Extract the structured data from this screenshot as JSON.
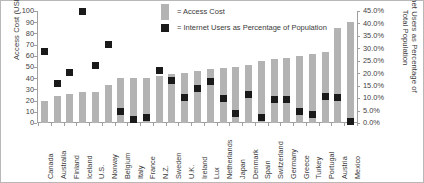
{
  "chart_data": {
    "type": "bar",
    "title": "",
    "subtitle": "",
    "xlabel": "",
    "ylabel": "Access Cost (USD)",
    "ylabel_superscript": "a",
    "y2label": "Internet Users as Percentage of Total Population",
    "ylim": [
      0,
      100
    ],
    "y2lim": [
      0,
      45
    ],
    "grid": false,
    "legend_position": "top-center",
    "y_ticks": [
      "0",
      "10",
      "20",
      "30",
      "40",
      "50",
      "60",
      "70",
      "80",
      "90",
      "100"
    ],
    "y_tick_values": [
      0,
      10,
      20,
      30,
      40,
      50,
      60,
      70,
      80,
      90,
      100
    ],
    "y2_ticks": [
      "0.0%",
      "5.0%",
      "10.0%",
      "15.0%",
      "20.0%",
      "25.0%",
      "30.0%",
      "35.0%",
      "40.0%",
      "45.0%"
    ],
    "y2_tick_values": [
      0,
      5,
      10,
      15,
      20,
      25,
      30,
      35,
      40,
      45
    ],
    "categories": [
      "Canada",
      "Australia",
      "Finland",
      "Iceland",
      "U.S.",
      "Norway",
      "Belgium",
      "Italy",
      "France",
      "N.Z.",
      "Sweden",
      "U.K.",
      "Ireland",
      "Lux",
      "Netherlands",
      "Japan",
      "Denmark",
      "Spain",
      "Switzerland",
      "Germany",
      "Greece",
      "Turkey",
      "Portugal",
      "Austria",
      "Mexico"
    ],
    "series": [
      {
        "name": "Access Cost",
        "type": "bar",
        "axis": "left",
        "units": "USD",
        "color": "#b3b3b3",
        "values": [
          20,
          24,
          26,
          28,
          28,
          34,
          40,
          40,
          40,
          42,
          44,
          45,
          46,
          48,
          49,
          50,
          52,
          55,
          57,
          58,
          60,
          62,
          63,
          85,
          90
        ]
      },
      {
        "name": "Internet Users as Percentage of Population",
        "type": "scatter",
        "axis": "right",
        "units": "%",
        "color": "#1a1a1a",
        "values": [
          28.8,
          15.8,
          20.3,
          45.0,
          23.0,
          31.7,
          4.5,
          1.4,
          2.3,
          21.0,
          17.0,
          10.4,
          14.0,
          16.7,
          10.0,
          4.0,
          11.3,
          2.3,
          9.5,
          9.5,
          4.5,
          3.6,
          10.8,
          10.4,
          0.5
        ]
      }
    ]
  },
  "legend": {
    "items": [
      {
        "label": "= Access Cost",
        "swatch": "bar-swatch",
        "color": "#b3b3b3"
      },
      {
        "label": "= Internet Users as Percentage of Population",
        "swatch": "marker-swatch",
        "color": "#1a1a1a"
      }
    ]
  }
}
